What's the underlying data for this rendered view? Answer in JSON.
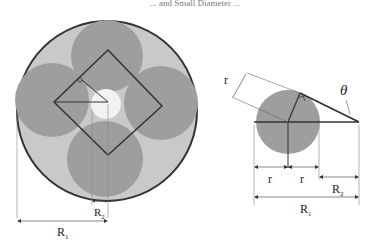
{
  "header_fragment": "... and Small Diameter ...",
  "left_figure": {
    "outer_radius_label": "R",
    "outer_radius_sub": "1",
    "inner_radius_label": "R",
    "inner_radius_sub": "2",
    "circle_count": 4
  },
  "right_figure": {
    "angle_label": "θ",
    "r_diag_label": "r",
    "r_left_label": "r",
    "r_right_label": "r",
    "R2_label": "R",
    "R2_sub": "2",
    "R1_label": "R",
    "R1_sub": "1"
  },
  "colors": {
    "outer_fill": "#c9c9c9",
    "circle_fill": "#9e9e9e",
    "line": "#333333",
    "center_hole": "#f2f2f2"
  }
}
